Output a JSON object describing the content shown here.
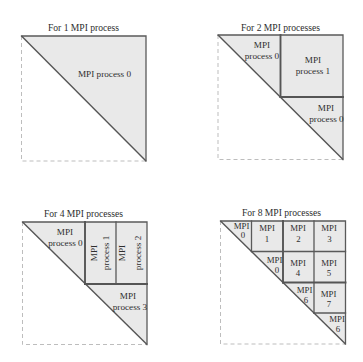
{
  "figure": {
    "colors": {
      "block_fill": "#e9e9e9",
      "block_edge": "#555555",
      "dashed_outline": "#bdbdbd",
      "text": "#2e2e2e"
    }
  },
  "panels": [
    {
      "title": "For 1 MPI process",
      "blocks": [
        {
          "lines": [
            "MPI process 0"
          ]
        }
      ]
    },
    {
      "title": "For 2 MPI processes",
      "blocks": [
        {
          "lines": [
            "MPI",
            "process 0"
          ]
        },
        {
          "lines": [
            "MPI",
            "process 1"
          ]
        },
        {
          "lines": [
            "MPI",
            "process 0"
          ]
        }
      ]
    },
    {
      "title": "For 4 MPI processes",
      "blocks": [
        {
          "lines": [
            "MPI",
            "process 0"
          ]
        },
        {
          "lines": [
            "MPI",
            "process 1"
          ]
        },
        {
          "lines": [
            "MPI",
            "process 2"
          ]
        },
        {
          "lines": [
            "MPI",
            "process 3"
          ]
        }
      ]
    },
    {
      "title": "For 8 MPI processes",
      "blocks": [
        {
          "lines": [
            "MPI",
            "0"
          ]
        },
        {
          "lines": [
            "MPI",
            "1"
          ]
        },
        {
          "lines": [
            "MPI",
            "2"
          ]
        },
        {
          "lines": [
            "MPI",
            "3"
          ]
        },
        {
          "lines": [
            "MPI",
            "0"
          ]
        },
        {
          "lines": [
            "MPI",
            "4"
          ]
        },
        {
          "lines": [
            "MPI",
            "5"
          ]
        },
        {
          "lines": [
            "MPI",
            "6"
          ]
        },
        {
          "lines": [
            "MPI",
            "7"
          ]
        },
        {
          "lines": [
            "MPI",
            "6"
          ]
        }
      ]
    }
  ]
}
